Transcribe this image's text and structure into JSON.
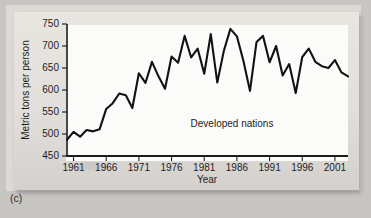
{
  "caption": "(c)",
  "chart_data": {
    "type": "line",
    "title": "",
    "xlabel": "Year",
    "ylabel": "Metric tons per person",
    "annotation": "Developed nations",
    "grid": false,
    "legend_position": "none",
    "line_color": "#121212",
    "xlim": [
      1960,
      2003
    ],
    "ylim": [
      450,
      750
    ],
    "ytick_labels": [
      "450",
      "500",
      "550",
      "600",
      "650",
      "700",
      "750"
    ],
    "yticks": [
      450,
      500,
      550,
      600,
      650,
      700,
      750
    ],
    "xtick_labels": [
      "1961",
      "1966",
      "1971",
      "1976",
      "1981",
      "1986",
      "1991",
      "1996",
      "2001"
    ],
    "xticks": [
      1961,
      1966,
      1971,
      1976,
      1981,
      1986,
      1991,
      1996,
      2001
    ],
    "x": [
      1960,
      1961,
      1962,
      1963,
      1964,
      1965,
      1966,
      1967,
      1968,
      1969,
      1970,
      1971,
      1972,
      1973,
      1974,
      1975,
      1976,
      1977,
      1978,
      1979,
      1980,
      1981,
      1982,
      1983,
      1984,
      1985,
      1986,
      1987,
      1988,
      1989,
      1990,
      1991,
      1992,
      1993,
      1994,
      1995,
      1996,
      1997,
      1998,
      1999,
      2000,
      2001,
      2002,
      2003
    ],
    "values": [
      487,
      505,
      494,
      509,
      506,
      511,
      557,
      570,
      592,
      588,
      559,
      638,
      616,
      664,
      631,
      603,
      676,
      662,
      723,
      674,
      694,
      637,
      727,
      617,
      689,
      739,
      722,
      666,
      598,
      709,
      723,
      663,
      700,
      633,
      659,
      593,
      675,
      694,
      664,
      654,
      650,
      668,
      640,
      631
    ]
  }
}
